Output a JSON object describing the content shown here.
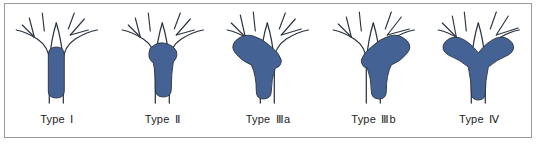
{
  "figure": {
    "panel_count": 5,
    "border_color": "#9a9a9a",
    "background_color": "#ffffff"
  },
  "style": {
    "lesion_fill": "#456294",
    "vessel_stroke": "#2b3440",
    "caption_color": "#1d1d1d"
  },
  "panels": [
    {
      "id": "type-1",
      "caption_prefix": "Type",
      "caption_numeral": "Ⅰ",
      "caption_full": "Type Ⅰ",
      "lesion_extent": "trunk-only",
      "lesion_path": "M 44 52 Q 44 44 52 44 Q 60 44 60 52 L 60 88 Q 60 95 52 95 Q 44 95 44 88 Z"
    },
    {
      "id": "type-2",
      "caption_prefix": "Type",
      "caption_numeral": "Ⅱ",
      "caption_full": "Type Ⅱ",
      "lesion_extent": "reaches-bifurcation",
      "lesion_path": "M 40 45 Q 47 39 53 40 Q 62 41 66 48 Q 68 54 63 59 Q 61 70 61 86 Q 61 94 53 94 Q 45 94 45 86 Q 45 68 43 60 Q 36 55 40 45 Z"
    },
    {
      "id": "type-3a",
      "caption_prefix": "Type",
      "caption_numeral": "Ⅲ",
      "caption_suffix": "a",
      "caption_full": "Type Ⅲa",
      "lesion_extent": "extends-left-branch",
      "lesion_path": "M 20 38 Q 28 30 38 33 Q 48 36 56 44 Q 64 50 66 57 Q 66 64 60 65 Q 56 76 56 88 Q 56 96 48 96 Q 41 96 41 88 Q 41 72 36 62 Q 26 58 20 50 Q 15 44 20 38 Z"
    },
    {
      "id": "type-3b",
      "caption_prefix": "Type",
      "caption_numeral": "Ⅲ",
      "caption_suffix": "b",
      "caption_full": "Type Ⅲb",
      "lesion_extent": "extends-right-branch",
      "lesion_path": "M 86 38 Q 78 30 68 33 Q 58 36 50 44 Q 42 50 40 57 Q 40 64 46 65 Q 50 76 50 88 Q 50 96 58 96 Q 65 96 65 88 Q 65 72 70 62 Q 80 58 86 50 Q 91 44 86 38 Z"
    },
    {
      "id": "type-4",
      "caption_prefix": "Type",
      "caption_numeral": "Ⅳ",
      "caption_full": "Type Ⅳ",
      "lesion_extent": "extends-both-branches",
      "lesion_path": "M 18 40 Q 24 32 34 35 Q 44 39 52 50 Q 60 39 70 35 Q 80 32 86 40 Q 90 47 82 52 Q 70 57 62 64 Q 59 78 59 90 Q 59 97 52 97 Q 45 97 45 90 Q 45 78 42 64 Q 34 57 22 52 Q 14 47 18 40 Z"
    }
  ],
  "tree": {
    "trunk_legs": "two-parallel-lines",
    "branches": "bifurcation-with-secondary-twigs"
  }
}
